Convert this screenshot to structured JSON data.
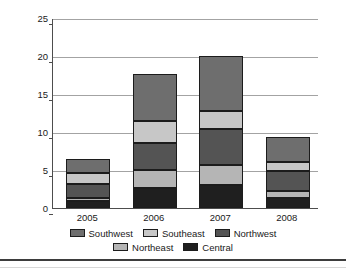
{
  "chart_data": {
    "type": "bar",
    "stacked": true,
    "title": "",
    "xlabel": "",
    "ylabel": "Sales (In Millions)",
    "categories": [
      "2005",
      "2006",
      "2007",
      "2008"
    ],
    "ylim": [
      0,
      25
    ],
    "yticks": [
      0,
      5,
      10,
      15,
      20,
      25
    ],
    "ytick_labels": [
      "0",
      "5",
      "10",
      "15",
      "20",
      "25"
    ],
    "grid": "horizontal",
    "legend_position": "bottom",
    "series": [
      {
        "name": "Central",
        "color": "#1f1f1f",
        "values": [
          0.9,
          2.6,
          3.0,
          1.3
        ]
      },
      {
        "name": "Northeast",
        "color": "#b5b5b5",
        "values": [
          0.4,
          2.4,
          2.7,
          1.0
        ]
      },
      {
        "name": "Northwest",
        "color": "#545454",
        "values": [
          1.9,
          3.6,
          4.7,
          2.6
        ]
      },
      {
        "name": "Southeast",
        "color": "#c7c7c7",
        "values": [
          1.4,
          2.8,
          2.4,
          1.2
        ]
      },
      {
        "name": "Southwest",
        "color": "#6e6e6e",
        "values": [
          1.9,
          6.2,
          7.2,
          3.2
        ]
      }
    ],
    "totals": [
      6.5,
      17.6,
      20.0,
      9.3
    ],
    "legend_order": [
      "Southwest",
      "Southeast",
      "Northwest",
      "Northeast",
      "Central"
    ],
    "stack_order_bottom_to_top": [
      "Central",
      "Northeast",
      "Northwest",
      "Southeast",
      "Southwest"
    ]
  },
  "axis": {
    "y_title": "Sales (In Millions)"
  },
  "legend": {
    "row1": [
      "Southwest",
      "Southeast",
      "Northwest"
    ],
    "row2": [
      "Northeast",
      "Central"
    ]
  },
  "colors": {
    "central": "#1f1f1f",
    "northeast": "#b5b5b5",
    "northwest": "#545454",
    "southeast": "#c7c7c7",
    "southwest": "#6e6e6e",
    "axis": "#4d4d4d",
    "grid": "#a3a3a3",
    "text": "#1a1a1a",
    "background": "#ffffff"
  }
}
